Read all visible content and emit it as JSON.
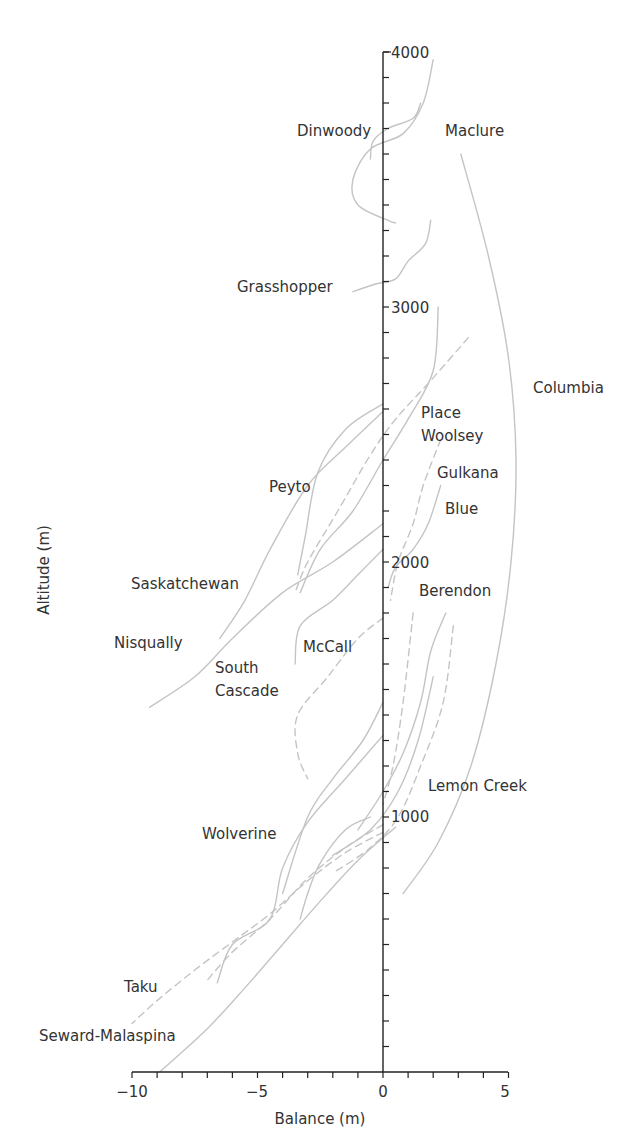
{
  "chart_data": {
    "type": "line",
    "title": "",
    "xlabel": "Balance (m)",
    "ylabel": "Altitude (m)",
    "xlim": [
      -10,
      5
    ],
    "ylim": [
      0,
      4000
    ],
    "x_ticks": [
      -10,
      -5,
      0,
      5
    ],
    "x_tick_labels": [
      "−10",
      "−5",
      "0",
      "5"
    ],
    "x_minor_step": 1,
    "y_ticks": [
      1000,
      2000,
      3000,
      4000
    ],
    "y_tick_labels": [
      "1000",
      "2000",
      "3000",
      "4000"
    ],
    "y_minor_step": 100,
    "grid": false,
    "legend": "inline labels",
    "line_color": "#c4c4c4",
    "label_color": "#333333",
    "axis_color": "#222222",
    "series": [
      {
        "name": "Dinwoody",
        "style": "solid",
        "label_pos": [
          -0.3,
          3730
        ],
        "points": [
          [
            2.0,
            3970
          ],
          [
            1.6,
            3800
          ],
          [
            0.8,
            3680
          ],
          [
            -0.5,
            3620
          ],
          [
            -1.2,
            3500
          ],
          [
            -1.0,
            3400
          ],
          [
            0.2,
            3340
          ],
          [
            0.5,
            3330
          ]
        ]
      },
      {
        "name": "Maclure",
        "style": "solid",
        "label_pos": [
          2.5,
          3730
        ],
        "points": [
          [
            1.5,
            3800
          ],
          [
            1.2,
            3740
          ],
          [
            0.2,
            3700
          ],
          [
            -0.4,
            3650
          ],
          [
            -0.5,
            3580
          ]
        ]
      },
      {
        "name": "Grasshopper",
        "style": "solid",
        "label_pos": [
          -1.8,
          3080
        ],
        "points": [
          [
            1.9,
            3340
          ],
          [
            1.7,
            3250
          ],
          [
            1.0,
            3180
          ],
          [
            0.5,
            3110
          ],
          [
            -0.3,
            3090
          ],
          [
            -1.2,
            3060
          ]
        ]
      },
      {
        "name": "Columbia",
        "style": "solid",
        "label_pos": [
          6.0,
          2640
        ],
        "points": [
          [
            3.1,
            3600
          ],
          [
            4.2,
            3200
          ],
          [
            5.0,
            2800
          ],
          [
            5.3,
            2400
          ],
          [
            5.1,
            2000
          ],
          [
            4.5,
            1600
          ],
          [
            3.5,
            1200
          ],
          [
            2.2,
            900
          ],
          [
            0.8,
            700
          ]
        ]
      },
      {
        "name": "Place",
        "style": "solid",
        "label_pos": [
          1.5,
          2650
        ],
        "points": [
          [
            2.2,
            3000
          ],
          [
            2.0,
            2750
          ],
          [
            1.0,
            2560
          ],
          [
            0.0,
            2400
          ],
          [
            -1.2,
            2200
          ],
          [
            -2.5,
            2050
          ],
          [
            -3.3,
            1880
          ]
        ]
      },
      {
        "name": "Woolsey",
        "style": "dashed",
        "label_pos": [
          1.5,
          2560
        ],
        "points": [
          [
            3.4,
            2880
          ],
          [
            1.8,
            2700
          ],
          [
            0.5,
            2560
          ],
          [
            -0.5,
            2420
          ],
          [
            -1.8,
            2200
          ],
          [
            -3.0,
            2000
          ],
          [
            -3.5,
            1880
          ]
        ]
      },
      {
        "name": "Gulkana",
        "style": "dashed",
        "label_pos": [
          2.2,
          2420
        ],
        "points": [
          [
            2.3,
            2480
          ],
          [
            1.6,
            2300
          ],
          [
            1.2,
            2150
          ],
          [
            0.6,
            2000
          ],
          [
            0.3,
            1850
          ]
        ]
      },
      {
        "name": "Blue",
        "style": "solid",
        "label_pos": [
          2.6,
          2270
        ],
        "points": [
          [
            2.3,
            2300
          ],
          [
            1.8,
            2150
          ],
          [
            1.2,
            2050
          ],
          [
            0.5,
            1980
          ],
          [
            0.2,
            1900
          ]
        ]
      },
      {
        "name": "Peyto",
        "style": "solid",
        "label_pos": [
          -2.9,
          2400
        ],
        "points": [
          [
            0.0,
            2620
          ],
          [
            -1.5,
            2520
          ],
          [
            -2.6,
            2350
          ],
          [
            -3.1,
            2100
          ],
          [
            -3.4,
            1950
          ]
        ]
      },
      {
        "name": "Saskatchewan",
        "style": "solid",
        "label_pos": [
          -7.0,
          1880
        ],
        "points": [
          [
            0.0,
            2590
          ],
          [
            -1.5,
            2450
          ],
          [
            -3.0,
            2300
          ],
          [
            -4.5,
            2050
          ],
          [
            -5.5,
            1850
          ],
          [
            -6.5,
            1700
          ]
        ]
      },
      {
        "name": "Nisqually",
        "style": "solid",
        "label_pos": [
          -8.7,
          1680
        ],
        "points": [
          [
            0.0,
            2150
          ],
          [
            -2.0,
            2000
          ],
          [
            -4.0,
            1880
          ],
          [
            -6.0,
            1700
          ],
          [
            -7.5,
            1550
          ],
          [
            -9.3,
            1430
          ]
        ]
      },
      {
        "name": "McCall",
        "style": "solid",
        "label_pos": [
          -2.0,
          1680
        ],
        "points": [
          [
            0.0,
            2050
          ],
          [
            -1.0,
            1950
          ],
          [
            -2.0,
            1850
          ],
          [
            -3.3,
            1750
          ],
          [
            -3.5,
            1600
          ]
        ]
      },
      {
        "name": "South Cascade",
        "style": "dashed",
        "label_pos": [
          -4.8,
          1600
        ],
        "points": [
          [
            0.0,
            1780
          ],
          [
            -1.0,
            1700
          ],
          [
            -2.2,
            1550
          ],
          [
            -3.4,
            1400
          ],
          [
            -3.4,
            1250
          ],
          [
            -3.0,
            1150
          ]
        ]
      },
      {
        "name": "Berendon",
        "style": "solid",
        "label_pos": [
          2.6,
          1880
        ],
        "points": [
          [
            2.5,
            1800
          ],
          [
            1.9,
            1650
          ],
          [
            1.5,
            1450
          ],
          [
            0.8,
            1250
          ],
          [
            0.0,
            1100
          ],
          [
            -1.0,
            950
          ]
        ]
      },
      {
        "name": "Berendon-lower",
        "style": "solid",
        "label_pos": null,
        "points": [
          [
            2.0,
            1550
          ],
          [
            1.4,
            1300
          ],
          [
            0.6,
            1100
          ],
          [
            -0.5,
            950
          ],
          [
            -2.0,
            850
          ]
        ]
      },
      {
        "name": "Lemon Creek",
        "style": "dashed",
        "label_pos": [
          3.2,
          1100
        ],
        "points": [
          [
            2.8,
            1750
          ],
          [
            2.4,
            1450
          ],
          [
            1.5,
            1200
          ],
          [
            0.6,
            1000
          ],
          [
            -0.5,
            880
          ],
          [
            -2.0,
            780
          ]
        ]
      },
      {
        "name": "Lemon Creek-b",
        "style": "dashed",
        "label_pos": null,
        "points": [
          [
            1.2,
            1800
          ],
          [
            0.8,
            1450
          ],
          [
            0.4,
            1200
          ],
          [
            0.0,
            1050
          ]
        ]
      },
      {
        "name": "Wolverine",
        "style": "solid",
        "label_pos": [
          -5.7,
          950
        ],
        "points": [
          [
            0.0,
            1320
          ],
          [
            -1.5,
            1150
          ],
          [
            -3.0,
            980
          ],
          [
            -4.0,
            800
          ],
          [
            -4.5,
            600
          ],
          [
            -6.0,
            500
          ],
          [
            -6.6,
            350
          ]
        ]
      },
      {
        "name": "Wolverine-b",
        "style": "solid",
        "label_pos": null,
        "points": [
          [
            0.0,
            1450
          ],
          [
            -0.8,
            1300
          ],
          [
            -2.0,
            1150
          ],
          [
            -3.0,
            1000
          ],
          [
            -4.0,
            700
          ]
        ]
      },
      {
        "name": "Wolverine-c",
        "style": "solid",
        "label_pos": null,
        "points": [
          [
            -0.5,
            1000
          ],
          [
            -1.5,
            950
          ],
          [
            -2.5,
            820
          ],
          [
            -3.0,
            700
          ],
          [
            -3.3,
            600
          ]
        ]
      },
      {
        "name": "Taku",
        "style": "dashed",
        "label_pos": [
          -8.8,
          320
        ],
        "points": [
          [
            0.0,
            940
          ],
          [
            -1.5,
            860
          ],
          [
            -3.0,
            750
          ],
          [
            -4.5,
            620
          ],
          [
            -6.0,
            510
          ],
          [
            -7.5,
            400
          ],
          [
            -9.0,
            280
          ],
          [
            -10.0,
            190
          ]
        ]
      },
      {
        "name": "Seward-Malaspina",
        "style": "dashed",
        "label_pos": [
          -9.5,
          160
        ],
        "points": [
          [
            0.0,
            970
          ],
          [
            -1.5,
            880
          ],
          [
            -3.0,
            760
          ],
          [
            -4.5,
            600
          ],
          [
            -6.0,
            470
          ],
          [
            -7.0,
            360
          ]
        ]
      },
      {
        "name": "Seward-Malaspina-solid",
        "style": "solid",
        "label_pos": null,
        "points": [
          [
            0.5,
            960
          ],
          [
            -1.0,
            830
          ],
          [
            -2.5,
            670
          ],
          [
            -4.0,
            500
          ],
          [
            -5.5,
            330
          ],
          [
            -7.0,
            170
          ],
          [
            -8.9,
            0
          ]
        ]
      }
    ],
    "labels": [
      "Dinwoody",
      "Maclure",
      "Grasshopper",
      "Columbia",
      "Place",
      "Woolsey",
      "Gulkana",
      "Blue",
      "Peyto",
      "Saskatchewan",
      "Nisqually",
      "McCall",
      "South Cascade",
      "Berendon",
      "Lemon Creek",
      "Wolverine",
      "Taku",
      "Seward-Malaspina"
    ]
  },
  "text": {
    "xlabel": "Balance (m)",
    "ylabel": "Altitude (m)",
    "ytick_4000": "4000",
    "ytick_3000": "3000",
    "ytick_2000": "2000",
    "ytick_1000": "1000",
    "xtick_m10": "−10",
    "xtick_m5": "−5",
    "xtick_0": "0",
    "xtick_5": "5",
    "label_dinwoody": "Dinwoody",
    "label_maclure": "Maclure",
    "label_grasshopper": "Grasshopper",
    "label_columbia": "Columbia",
    "label_place": "Place",
    "label_woolsey": "Woolsey",
    "label_gulkana": "Gulkana",
    "label_blue": "Blue",
    "label_peyto": "Peyto",
    "label_saskatchewan": "Saskatchewan",
    "label_nisqually": "Nisqually",
    "label_mccall": "McCall",
    "label_south": "South",
    "label_cascade": "Cascade",
    "label_berendon": "Berendon",
    "label_lemon_creek": "Lemon Creek",
    "label_wolverine": "Wolverine",
    "label_taku": "Taku",
    "label_seward_malaspina": "Seward-Malaspina"
  }
}
